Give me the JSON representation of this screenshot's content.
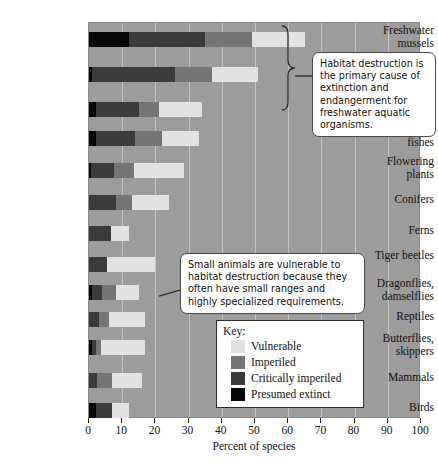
{
  "chart_data": {
    "type": "bar",
    "orientation": "horizontal",
    "stacked": true,
    "title": "",
    "xlabel": "Percent of species",
    "ylabel": "",
    "xlim": [
      0,
      100
    ],
    "xticks": [
      0,
      10,
      20,
      30,
      40,
      50,
      60,
      70,
      80,
      90,
      100
    ],
    "grid": "vertical",
    "legend_position": "inside-lower-right",
    "categories": [
      "Freshwater mussels",
      "Crayfishes",
      "Amphibians",
      "Freshwater fishes",
      "Flowering plants",
      "Conifers",
      "Ferns",
      "Tiger beetles",
      "Dragonflies, damselflies",
      "Reptiles",
      "Butterflies, skippers",
      "Mammals",
      "Birds"
    ],
    "series": [
      {
        "name": "Presumed extinct",
        "color": "#070707",
        "values": [
          12,
          1,
          2,
          2,
          0.6,
          0,
          0,
          0,
          1,
          0,
          0.8,
          0,
          2
        ]
      },
      {
        "name": "Critically imperiled",
        "color": "#3b3b3b",
        "values": [
          23,
          25,
          13,
          12,
          7,
          8,
          6.5,
          5.5,
          3,
          3,
          1.2,
          2.5,
          5
        ]
      },
      {
        "name": "Imperiled",
        "color": "#757575",
        "values": [
          14,
          11,
          6,
          8,
          6,
          5,
          0,
          0,
          4,
          3,
          1.5,
          4.5,
          0
        ]
      },
      {
        "name": "Vulnerable",
        "color": "#e2e2e2",
        "values": [
          16,
          14,
          13,
          11,
          15,
          11,
          5.5,
          14.5,
          7,
          11,
          13.5,
          9,
          5
        ]
      }
    ]
  },
  "axis": {
    "x_title": "Percent of species",
    "tick_labels": [
      "0",
      "10",
      "20",
      "30",
      "40",
      "50",
      "60",
      "70",
      "80",
      "90",
      "100"
    ]
  },
  "legend": {
    "title": "Key:",
    "items": [
      {
        "label": "Vulnerable",
        "color": "#e2e2e2"
      },
      {
        "label": "Imperiled",
        "color": "#757575"
      },
      {
        "label": "Critically imperiled",
        "color": "#3b3b3b"
      },
      {
        "label": "Presumed extinct",
        "color": "#070707"
      }
    ]
  },
  "callouts": {
    "top": "Habitat destruction is the primary cause of extinction and endangerment for freshwater aquatic organisms.",
    "bottom": "Small animals are vulnerable to habitat destruction because they often have small ranges and highly specialized requirements."
  }
}
